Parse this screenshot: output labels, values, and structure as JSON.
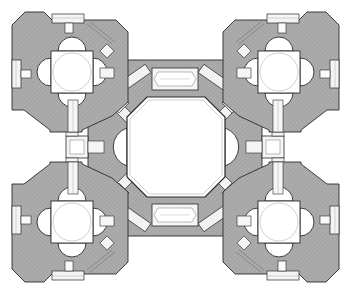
{
  "diagram": {
    "type": "architectural-floor-plan",
    "colors": {
      "background": "#ffffff",
      "wall_fill": "#a9a9a9",
      "wall_hatch": "#8a8a8a",
      "line": "#2a2a2a",
      "light_line": "#9a9a9a",
      "room_fill": "#ffffff"
    },
    "central_space": {
      "shape": "octagon",
      "cx": 176,
      "cy": 147
    },
    "corner_towers": [
      {
        "name": "tower-top-left",
        "cx": 72,
        "cy": 72
      },
      {
        "name": "tower-top-right",
        "cx": 279,
        "cy": 72
      },
      {
        "name": "tower-bottom-left",
        "cx": 72,
        "cy": 222
      },
      {
        "name": "tower-bottom-right",
        "cx": 279,
        "cy": 222
      }
    ],
    "axial_passages": [
      "top",
      "bottom",
      "left",
      "right"
    ]
  }
}
